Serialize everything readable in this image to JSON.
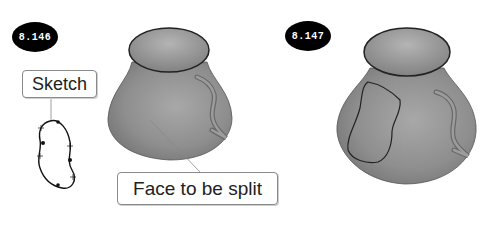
{
  "figures": [
    {
      "id": "left",
      "badge": "8.146"
    },
    {
      "id": "right",
      "badge": "8.147"
    }
  ],
  "callouts": {
    "sketch": "Sketch",
    "face": "Face to be split"
  },
  "colors": {
    "badge_bg": "#000000",
    "badge_text": "#ffffff",
    "body_fill": "#8c8c8c",
    "rim_fill": "#a0a0a0",
    "outline": "#2a2a2a"
  }
}
